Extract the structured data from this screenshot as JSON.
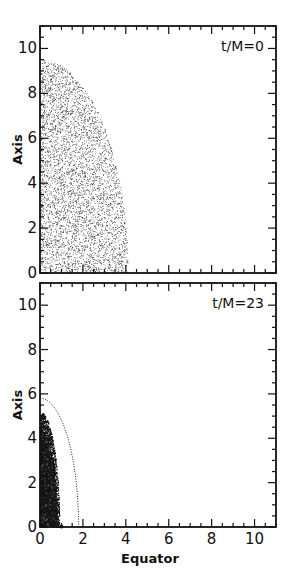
{
  "chart_data": [
    {
      "type": "scatter",
      "panel": "top",
      "title": "t/M=0",
      "xlabel": "",
      "ylabel": "Axis",
      "xlim": [
        0,
        11
      ],
      "ylim": [
        0,
        11
      ],
      "xticks": [
        0,
        2,
        4,
        6,
        8,
        10
      ],
      "yticks": [
        0,
        2,
        4,
        6,
        8,
        10
      ],
      "yticklabels": [
        "0",
        "2",
        "4",
        "6",
        "8",
        "10"
      ],
      "grid": false,
      "description": "Uniform random particle distribution filling a quarter-ellipsoid region, extending to ~9.5 along Axis and ~4.1 along Equator",
      "distribution": {
        "axis_extent": 9.5,
        "equator_extent": 4.1,
        "density": "sparse"
      }
    },
    {
      "type": "scatter",
      "panel": "bottom",
      "title": "t/M=23",
      "xlabel": "Equator",
      "ylabel": "Axis",
      "xlim": [
        0,
        11
      ],
      "ylim": [
        0,
        11
      ],
      "xticks": [
        0,
        2,
        4,
        6,
        8,
        10
      ],
      "xticklabels": [
        "0",
        "2",
        "4",
        "6",
        "8",
        "10"
      ],
      "yticks": [
        0,
        2,
        4,
        6,
        8,
        10
      ],
      "yticklabels": [
        "0",
        "2",
        "4",
        "6",
        "8",
        "10"
      ],
      "grid": false,
      "description": "Collapsed dense particle distribution near the axis, extending to ~5.2 along Axis and ~0.9 along Equator; dotted curve (horizon-like boundary) from (0,~5.8) to (~1.8,0); single dot marker at (~1.0, 0)",
      "distribution": {
        "axis_extent": 5.2,
        "equator_extent": 0.9,
        "density": "dense"
      },
      "dotted_curve": {
        "axis_intercept": 5.8,
        "equator_intercept": 1.8
      },
      "marker": {
        "x": 1.0,
        "y": 0
      }
    }
  ],
  "labels": {
    "top_title": "t/M=0",
    "bottom_title": "t/M=23",
    "ylabel": "Axis",
    "xlabel": "Equator",
    "ticks": [
      "0",
      "2",
      "4",
      "6",
      "8",
      "10"
    ]
  }
}
